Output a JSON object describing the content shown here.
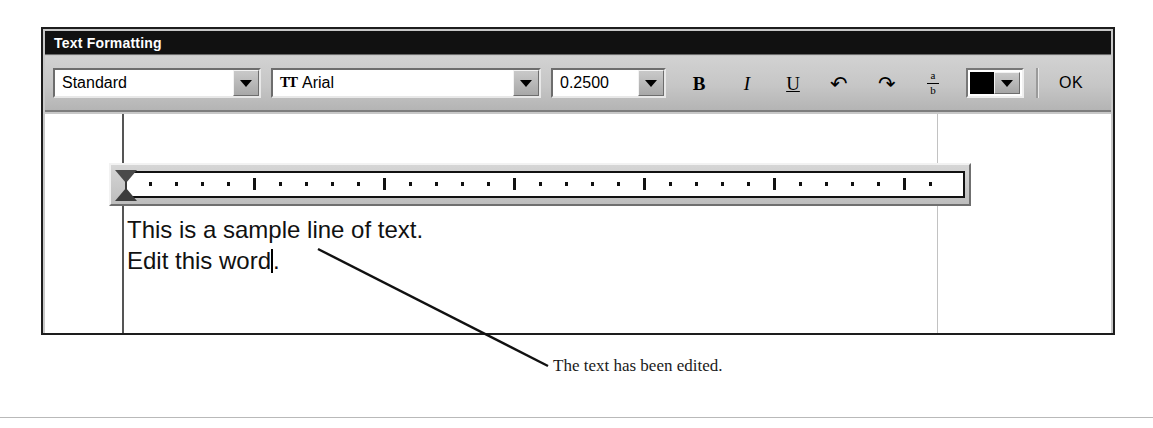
{
  "dialog": {
    "title": "Text Formatting"
  },
  "toolbar": {
    "style_combo": {
      "name": "paragraph-style",
      "value": "Standard",
      "arrow_icon": "chevron-down-icon"
    },
    "font_combo": {
      "name": "font-family",
      "value": "Arial",
      "type_icon": "truetype-icon",
      "type_icon_glyph": "TT",
      "arrow_icon": "chevron-down-icon"
    },
    "size_combo": {
      "name": "font-size",
      "value": "0.2500",
      "arrow_icon": "chevron-down-icon"
    },
    "bold": {
      "label": "B",
      "icon": "bold-icon"
    },
    "italic": {
      "label": "I",
      "icon": "italic-icon"
    },
    "underline": {
      "label": "U",
      "icon": "underline-icon"
    },
    "undo": {
      "label": "↶",
      "icon": "undo-icon"
    },
    "redo": {
      "label": "↷",
      "icon": "redo-icon"
    },
    "fraction": {
      "numerator": "a",
      "denominator": "b",
      "icon": "stacked-fraction-icon"
    },
    "color": {
      "icon": "color-swatch-icon",
      "value": "#000000",
      "arrow_icon": "chevron-down-icon"
    },
    "ok_label": "OK"
  },
  "ruler": {
    "first_line_indent_icon": "indent-first-line-marker",
    "left_indent_icon": "indent-left-marker",
    "minor_tick_count": 24,
    "major_tick_positions": [
      4,
      9,
      14,
      19,
      24,
      29
    ]
  },
  "document": {
    "lines": [
      "This is a sample line of text.",
      "Edit this word"
    ],
    "line2_suffix": ".",
    "caret_visible": true
  },
  "callout": {
    "text": "The text has been edited."
  }
}
